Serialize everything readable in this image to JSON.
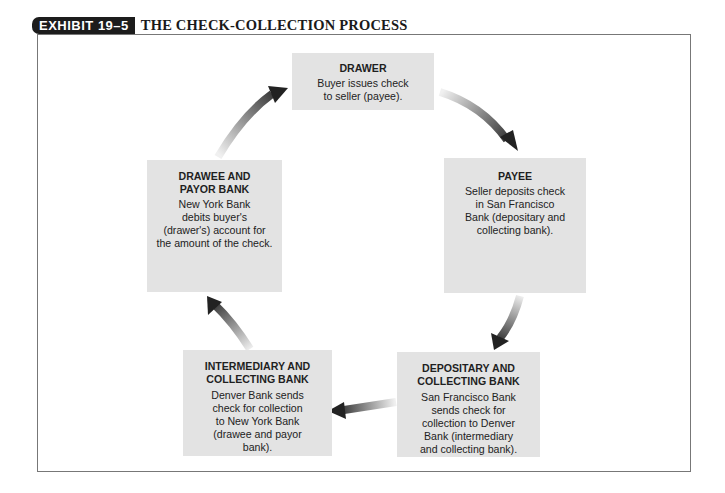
{
  "header": {
    "exhibit_label": "EXHIBIT 19–5",
    "title": "THE CHECK-COLLECTION PROCESS"
  },
  "nodes": [
    {
      "id": "drawer",
      "heading": "DRAWER",
      "body_lines": [
        "Buyer issues check",
        "to seller (payee)."
      ]
    },
    {
      "id": "payee",
      "heading": "PAYEE",
      "body_lines": [
        "Seller deposits check",
        "in San Francisco",
        "Bank (depositary and",
        "collecting bank)."
      ]
    },
    {
      "id": "depositary",
      "heading_lines": [
        "DEPOSITARY AND",
        "COLLECTING BANK"
      ],
      "body_lines": [
        "San Francisco Bank",
        "sends check for",
        "collection to Denver",
        "Bank (intermediary",
        "and collecting bank)."
      ]
    },
    {
      "id": "intermediary",
      "heading_lines": [
        "INTERMEDIARY AND",
        "COLLECTING BANK"
      ],
      "body_lines": [
        "Denver Bank sends",
        "check for collection",
        "to New York Bank",
        "(drawee and payor",
        "bank)."
      ]
    },
    {
      "id": "drawee",
      "heading_lines": [
        "DRAWEE AND",
        "PAYOR BANK"
      ],
      "body_lines": [
        "New York Bank",
        "debits buyer's",
        "(drawer's) account for",
        "the amount of the check."
      ]
    }
  ],
  "flow": [
    {
      "from": "drawer",
      "to": "payee",
      "icon": "curved-arrow-icon"
    },
    {
      "from": "payee",
      "to": "depositary",
      "icon": "curved-arrow-icon"
    },
    {
      "from": "depositary",
      "to": "intermediary",
      "icon": "curved-arrow-icon"
    },
    {
      "from": "intermediary",
      "to": "drawee",
      "icon": "curved-arrow-icon"
    },
    {
      "from": "drawee",
      "to": "drawer",
      "icon": "curved-arrow-icon"
    }
  ],
  "colors": {
    "box_fill": "#e3e3e3",
    "badge_fill": "#1c1c1c",
    "arrow_dark": "#2a2a2a",
    "frame_border": "#777777"
  }
}
